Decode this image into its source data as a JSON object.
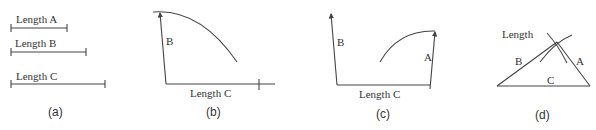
{
  "panels": [
    {
      "id": "a",
      "caption": "(a)",
      "segments": [
        {
          "label": "Length A"
        },
        {
          "label": "Length B"
        },
        {
          "label": "Length C"
        }
      ]
    },
    {
      "id": "b",
      "caption": "(b)",
      "side_label": "B",
      "base_label": "Length C"
    },
    {
      "id": "c",
      "caption": "(c)",
      "left_label": "B",
      "right_label": "A",
      "base_label": "Length C"
    },
    {
      "id": "d",
      "caption": "(d)",
      "title": "Length",
      "labels": {
        "left": "B",
        "base": "C",
        "right": "A"
      }
    }
  ]
}
